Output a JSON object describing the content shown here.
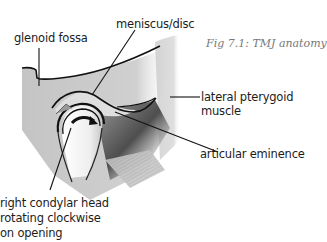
{
  "figure": {
    "caption": "Fig 7.1: TMJ anatomy",
    "labels": {
      "glenoid_fossa": "glenoid fossa",
      "meniscus": "meniscus/disc",
      "lateral_pterygoid_line1": "lateral pterygoid",
      "lateral_pterygoid_line2": "muscle",
      "articular_eminence": "articular eminence",
      "condyle_line1": "right condylar head",
      "condyle_line2": "rotating clockwise",
      "condyle_line3": "on opening"
    },
    "icons": [
      "clockwise-rotation-arrow-icon"
    ],
    "colors": {
      "bone": "#c8c8c8",
      "disc": "#dcdcdc",
      "muscle_dark": "#5a5a5a",
      "outline": "#111111",
      "caption": "#777777"
    }
  }
}
